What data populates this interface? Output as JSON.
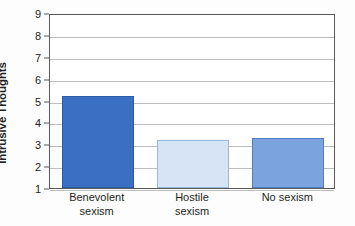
{
  "chart_data": {
    "type": "bar",
    "title": "",
    "xlabel": "",
    "ylabel": "Intrusive Thoughts",
    "categories": [
      "Benevolent sexism",
      "Hostile sexism",
      "No sexism"
    ],
    "category_lines": [
      [
        "Benevolent",
        "sexism"
      ],
      [
        "Hostile",
        "sexism"
      ],
      [
        "No sexism",
        ""
      ]
    ],
    "values": [
      5.2,
      3.2,
      3.3
    ],
    "ylim": [
      1,
      9
    ],
    "yticks": [
      1,
      2,
      3,
      4,
      5,
      6,
      7,
      8,
      9
    ],
    "ytick_labels": [
      "1",
      "2",
      "3",
      "4",
      "5",
      "6",
      "7",
      "8",
      "9"
    ],
    "grid": true,
    "legend": "none",
    "bar_colors": [
      "#3b6fc4",
      "#d6e4f5",
      "#7ba3dd"
    ],
    "bar_border_colors": [
      "#2b5aa8",
      "#9ab8dd",
      "#4e7ec4"
    ],
    "axis_color": "#58595b",
    "gridline_color": "#bcbec0",
    "background_color": "#fdfdfd",
    "plot_background_color": "#ffffff"
  }
}
